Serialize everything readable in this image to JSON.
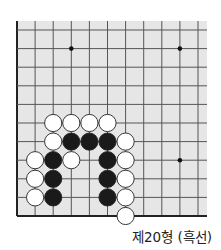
{
  "diagram": {
    "type": "go-problem",
    "caption": "제20형 (흑선)",
    "colors": {
      "board_background": "#e6e6e6",
      "grid_line": "#555555",
      "edge_line": "#222222",
      "black_stone": "#1a1a1a",
      "white_stone": "#ffffff",
      "stone_outline": "#222222"
    },
    "grid": {
      "origin_x": 17,
      "origin_y": 30,
      "spacing_x": 18.1,
      "spacing_y": 18.6,
      "cols": 11,
      "rows": 11,
      "board_left": 17,
      "board_top": 21,
      "board_right": 207,
      "board_bottom": 216,
      "edges": [
        "left",
        "bottom"
      ]
    },
    "star_points": [
      {
        "col": 3,
        "row": 1
      },
      {
        "col": 9,
        "row": 1
      },
      {
        "col": 9,
        "row": 7
      }
    ],
    "stones": [
      {
        "color": "white",
        "col": 2,
        "row": 5
      },
      {
        "color": "white",
        "col": 3,
        "row": 5
      },
      {
        "color": "white",
        "col": 4,
        "row": 5
      },
      {
        "color": "white",
        "col": 5,
        "row": 5
      },
      {
        "color": "white",
        "col": 2,
        "row": 6
      },
      {
        "color": "black",
        "col": 3,
        "row": 6
      },
      {
        "color": "black",
        "col": 4,
        "row": 6
      },
      {
        "color": "black",
        "col": 5,
        "row": 6
      },
      {
        "color": "white",
        "col": 6,
        "row": 6
      },
      {
        "color": "white",
        "col": 1,
        "row": 7
      },
      {
        "color": "black",
        "col": 2,
        "row": 7
      },
      {
        "color": "white",
        "col": 3,
        "row": 7
      },
      {
        "color": "black",
        "col": 5,
        "row": 7
      },
      {
        "color": "white",
        "col": 6,
        "row": 7
      },
      {
        "color": "white",
        "col": 1,
        "row": 8
      },
      {
        "color": "black",
        "col": 2,
        "row": 8
      },
      {
        "color": "black",
        "col": 5,
        "row": 8
      },
      {
        "color": "white",
        "col": 6,
        "row": 8
      },
      {
        "color": "white",
        "col": 1,
        "row": 9
      },
      {
        "color": "black",
        "col": 2,
        "row": 9
      },
      {
        "color": "black",
        "col": 5,
        "row": 9
      },
      {
        "color": "white",
        "col": 6,
        "row": 9
      },
      {
        "color": "white",
        "col": 6,
        "row": 10
      }
    ]
  }
}
